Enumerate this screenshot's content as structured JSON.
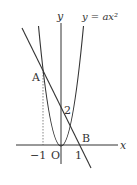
{
  "diagram": {
    "axes": {
      "x_label": "x",
      "y_label": "y",
      "origin_label": "O"
    },
    "curve_label": "y = ax²",
    "ticks": {
      "x_neg": "−1",
      "x_pos": "1",
      "y_intercept": "2"
    },
    "points": {
      "A": "A",
      "B": "B"
    },
    "colors": {
      "stroke": "#333333",
      "background": "#ffffff"
    }
  }
}
